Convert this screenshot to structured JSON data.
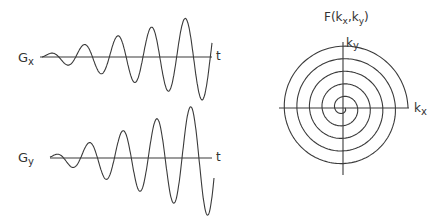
{
  "diagram": {
    "gx_panel": {
      "label_main": "G",
      "label_sub": "x",
      "axis_label": "t"
    },
    "gy_panel": {
      "label_main": "G",
      "label_sub": "y",
      "axis_label": "t"
    },
    "kspace_panel": {
      "title_prefix": "F(k",
      "title_sub1": "x",
      "title_mid": ",k",
      "title_sub2": "y",
      "title_suffix": ")",
      "vertical_axis_main": "k",
      "vertical_axis_sub": "y",
      "horizontal_axis_main": "k",
      "horizontal_axis_sub": "x"
    },
    "colors": {
      "line": "#3a3a3a",
      "text": "#333333",
      "background": "#ffffff"
    }
  }
}
